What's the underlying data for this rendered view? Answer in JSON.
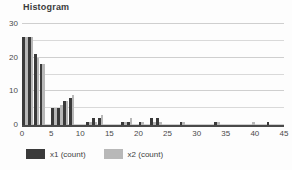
{
  "chart_data": {
    "type": "bar",
    "title": "Histogram",
    "xlabel": "",
    "ylabel": "",
    "xlim": [
      0,
      45
    ],
    "ylim": [
      0,
      30
    ],
    "x_ticks": [
      0,
      5,
      10,
      15,
      20,
      25,
      30,
      35,
      40,
      45
    ],
    "y_ticks": [
      0,
      10,
      20,
      30
    ],
    "gridlines": [
      0,
      5,
      10,
      15,
      20,
      25,
      30
    ],
    "grid": true,
    "legend_position": "bottom-left",
    "bin_width": 1,
    "series": [
      {
        "name": "x1 (count)",
        "color": "#3a3a3a",
        "bins": [
          0,
          1,
          2,
          3,
          5,
          6,
          7,
          8,
          11,
          12,
          13,
          17,
          18,
          20,
          22,
          23,
          27,
          33,
          42
        ],
        "values": [
          26,
          26,
          21,
          18,
          5,
          5,
          7,
          8,
          1,
          2,
          2,
          1,
          1,
          1,
          2,
          2,
          1,
          1,
          1
        ]
      },
      {
        "name": "x2 (count)",
        "color": "#b8b8b8",
        "bins": [
          0,
          1,
          2,
          3,
          5,
          6,
          7,
          8,
          11,
          12,
          13,
          17,
          18,
          20,
          22,
          23,
          27,
          33,
          39
        ],
        "values": [
          26,
          26,
          20,
          18,
          5,
          6,
          7,
          9,
          1,
          1,
          3,
          1,
          2,
          1,
          1,
          1,
          1,
          1,
          1
        ]
      }
    ]
  },
  "legend": {
    "items": [
      {
        "label": "x1 (count)",
        "color": "#3a3a3a"
      },
      {
        "label": "x2 (count)",
        "color": "#b8b8b8"
      }
    ]
  },
  "colors": {
    "series1": "#3a3a3a",
    "series2": "#b8b8b8",
    "grid": "#d9d9d9",
    "axis": "#4a4a4a",
    "text": "#3f3f3f",
    "background": "#fdfdfd"
  }
}
